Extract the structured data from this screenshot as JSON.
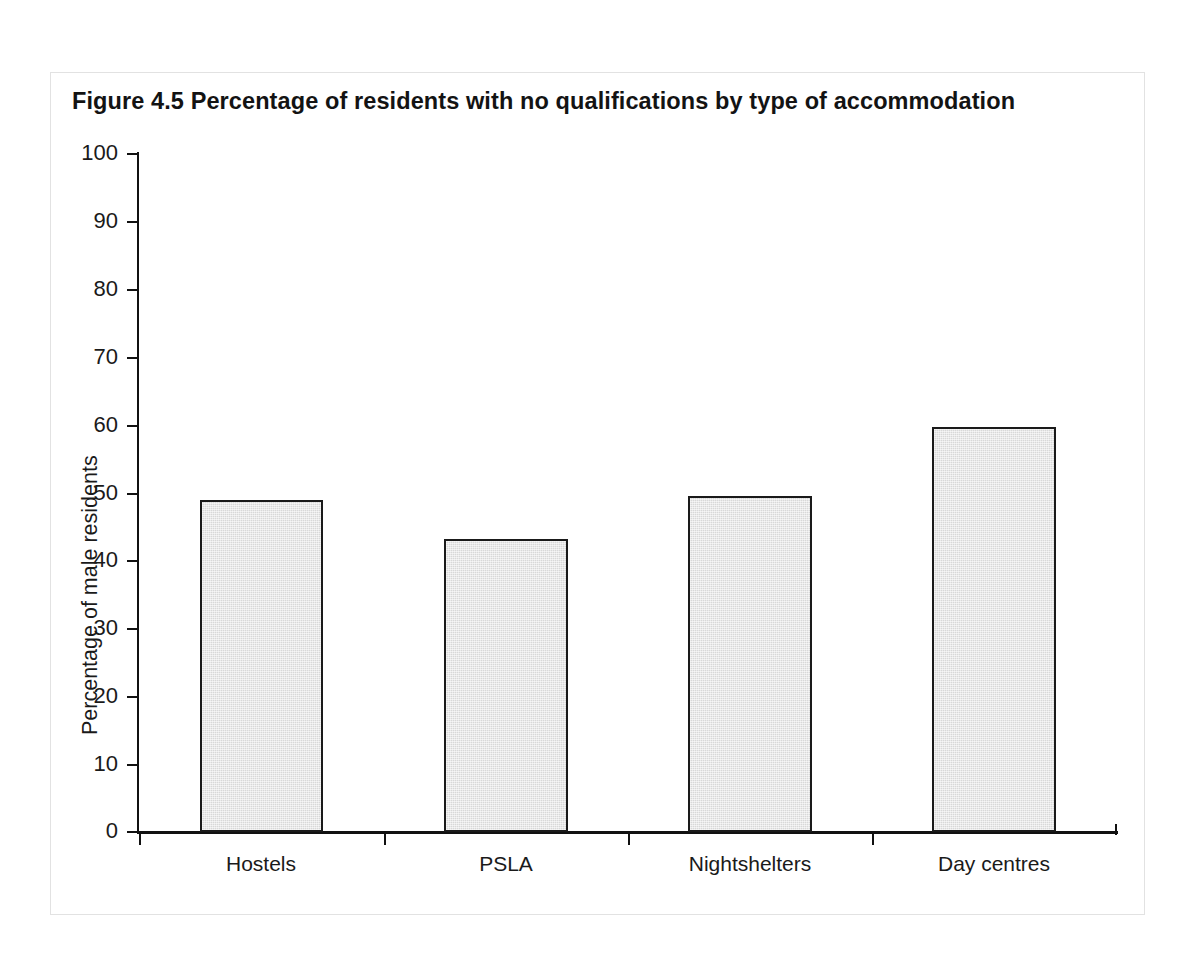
{
  "figure": {
    "title": "Figure 4.5  Percentage of residents with no qualifications by type of accommodation",
    "frame_border_color": "#e2e2e2",
    "background_color": "#ffffff"
  },
  "chart_data": {
    "type": "bar",
    "title": "Figure 4.5  Percentage of residents with no qualifications by type of accommodation",
    "categories": [
      "Hostels",
      "PSLA",
      "Nightshelters",
      "Day centres"
    ],
    "values": [
      49.0,
      43.2,
      49.5,
      59.7
    ],
    "xlabel": "",
    "ylabel": "Percentage of male residents",
    "ylim": [
      0,
      100
    ],
    "ytick_step": 10,
    "yticks": [
      0,
      10,
      20,
      30,
      40,
      50,
      60,
      70,
      80,
      90,
      100
    ],
    "ytick_labels": [
      "0",
      "10",
      "20",
      "30",
      "40",
      "50",
      "60",
      "70",
      "80",
      "90",
      "100"
    ],
    "grid": false,
    "legend": false,
    "legend_position": "none",
    "bar_fill_color": "#d8d8d8",
    "bar_edge_color": "#1a1a1a",
    "axis_color": "#111111"
  },
  "axes": {
    "y_title": "Percentage of male residents",
    "y_labels": [
      "100",
      "90",
      "80",
      "70",
      "60",
      "50",
      "40",
      "30",
      "20",
      "10",
      "0"
    ],
    "x_labels": [
      "Hostels",
      "PSLA",
      "Nightshelters",
      "Day centres"
    ]
  }
}
